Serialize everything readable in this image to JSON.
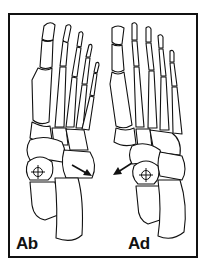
{
  "figure": {
    "type": "anatomical-line-illustration",
    "panels": [
      {
        "id": "left",
        "label": "Ab",
        "motion": "abduction",
        "arrow_direction": "outward-right"
      },
      {
        "id": "right",
        "label": "Ad",
        "motion": "adduction",
        "arrow_direction": "outward-left"
      }
    ],
    "colors": {
      "line": "#111111",
      "background": "#ffffff"
    }
  }
}
